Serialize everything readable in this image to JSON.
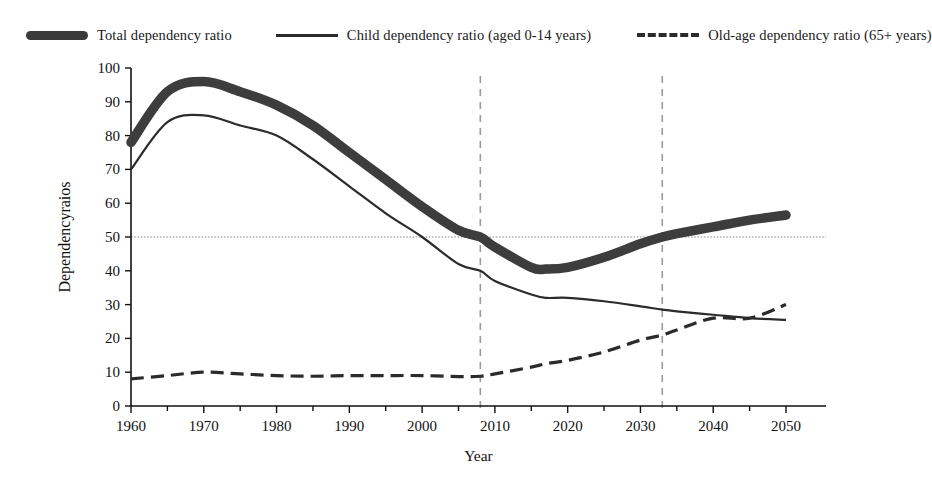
{
  "chart_data": {
    "type": "line",
    "title": "",
    "xlabel": "Year",
    "ylabel": "Dependencyraios",
    "xlim": [
      1960,
      2051
    ],
    "ylim": [
      0,
      100
    ],
    "ytick_labels": [
      "0",
      "10",
      "20",
      "30",
      "40",
      "50",
      "60",
      "70",
      "80",
      "90",
      "100"
    ],
    "yticks": [
      0,
      10,
      20,
      30,
      40,
      50,
      60,
      70,
      80,
      90,
      100
    ],
    "xtick_labels": [
      "1960",
      "1970",
      "1980",
      "1990",
      "2000",
      "2010",
      "2020",
      "2030",
      "2040",
      "2050"
    ],
    "xticks": [
      1960,
      1970,
      1980,
      1990,
      2000,
      2010,
      2020,
      2030,
      2040,
      2050
    ],
    "xminor_ticks": [
      1965,
      1975,
      1985,
      1995,
      2005,
      2015,
      2025,
      2035,
      2045
    ],
    "grid": false,
    "legend_position": "top",
    "reference_lines": {
      "horizontal": [
        {
          "value": 50,
          "style": "dotted",
          "color": "#8d8d8d"
        }
      ],
      "vertical": [
        {
          "value": 2008,
          "style": "dashed",
          "color": "#9a9a9a"
        },
        {
          "value": 2033,
          "style": "dashed",
          "color": "#9a9a9a"
        }
      ]
    },
    "x": [
      1960,
      1965,
      1970,
      1975,
      1980,
      1985,
      1990,
      1995,
      2000,
      2005,
      2008,
      2010,
      2015,
      2017,
      2020,
      2025,
      2030,
      2033,
      2035,
      2040,
      2045,
      2050
    ],
    "series": [
      {
        "name": "Total dependency ratio",
        "style": "thick-solid",
        "color": "#3d3d3d",
        "values": [
          78,
          93,
          96,
          93,
          89,
          83,
          75,
          67,
          59,
          52,
          50,
          47,
          41,
          40.5,
          41,
          44,
          48,
          50,
          51,
          53,
          55,
          56.5
        ]
      },
      {
        "name": "Child dependency ratio (aged 0-14 years)",
        "style": "thin-solid",
        "color": "#2b2b2b",
        "values": [
          70,
          84,
          86,
          83,
          80,
          73,
          65,
          57,
          50,
          42,
          40,
          37,
          33,
          32,
          32,
          31,
          29.5,
          28.5,
          28,
          27,
          26,
          25.5
        ]
      },
      {
        "name": "Old-age dependency ratio (65+ years)",
        "style": "dashed",
        "color": "#2b2b2b",
        "values": [
          8,
          9,
          10,
          9.5,
          9,
          8.8,
          9,
          9,
          9,
          8.7,
          8.8,
          9.5,
          11.5,
          12.5,
          13.5,
          16,
          19.5,
          21,
          22.5,
          26,
          26,
          30
        ]
      }
    ]
  },
  "legend": {
    "items": [
      {
        "label": "Total dependency ratio",
        "swatch": "thick-bar-swatch"
      },
      {
        "label": "Child dependency ratio (aged 0-14 years)",
        "swatch": "thin-line-swatch"
      },
      {
        "label": "Old-age dependency ratio (65+ years)",
        "swatch": "dashed-line-swatch"
      }
    ]
  }
}
